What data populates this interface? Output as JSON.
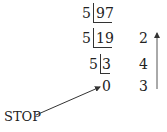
{
  "rows": [
    {
      "divisor": "5",
      "dividend": "97",
      "remainder": ""
    },
    {
      "divisor": "5",
      "dividend": "19",
      "remainder": "2"
    },
    {
      "divisor": "5",
      "dividend": "3",
      "remainder": "4"
    },
    {
      "divisor": "",
      "dividend": "0",
      "remainder": "3"
    }
  ],
  "stop_label": "STOP",
  "arrow_direction": "up"
}
